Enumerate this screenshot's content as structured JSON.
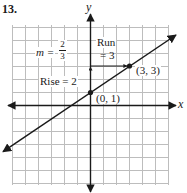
{
  "problem_number": "13.",
  "axes": {
    "x_label": "x",
    "y_label": "y"
  },
  "slope": {
    "prefix": "m =",
    "numerator": "2",
    "denominator": "3"
  },
  "run": {
    "line1": "Run",
    "line2": "= 3"
  },
  "rise": {
    "label": "Rise = 2"
  },
  "points": [
    {
      "label": "(0, 1)",
      "x": 0,
      "y": 1
    },
    {
      "label": "(3, 3)",
      "x": 3,
      "y": 3
    }
  ],
  "grid": {
    "x_min": -6,
    "x_max": 6,
    "y_min": -6,
    "y_max": 6,
    "cell_px": 13
  },
  "line": {
    "slope": "2/3",
    "y_intercept": 1
  },
  "colors": {
    "grid": "#bdbdbd",
    "ink": "#1a1a1a",
    "background": "#ffffff"
  }
}
